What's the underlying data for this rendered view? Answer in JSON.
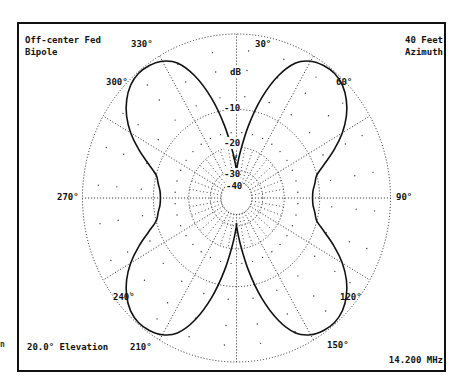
{
  "chart_data": {
    "type": "polar",
    "title": "Off-center Fed Bipole",
    "title_lines": [
      "Off-center Fed",
      "Bipole"
    ],
    "subtitle_lines": [
      "40 Feet",
      "Azimuth"
    ],
    "elevation_label": "20.0° Elevation",
    "frequency_label": "14.200 MHz",
    "radial_unit": "dB",
    "radial_ticks": [
      "-10",
      "-20",
      "-30",
      "-40"
    ],
    "radial_marker": "v",
    "angle_ticks": [
      {
        "angle": 0,
        "label": ""
      },
      {
        "angle": 30,
        "label": "30°"
      },
      {
        "angle": 60,
        "label": "60°"
      },
      {
        "angle": 90,
        "label": "90°"
      },
      {
        "angle": 120,
        "label": "120°"
      },
      {
        "angle": 150,
        "label": "150°"
      },
      {
        "angle": 180,
        "label": ""
      },
      {
        "angle": 210,
        "label": "210°"
      },
      {
        "angle": 240,
        "label": "240°"
      },
      {
        "angle": 270,
        "label": "270°"
      },
      {
        "angle": 300,
        "label": "300°"
      },
      {
        "angle": 330,
        "label": "330°"
      }
    ],
    "rings_db": [
      0,
      -10,
      -20,
      -30,
      -40
    ],
    "series": [
      {
        "name": "Azimuth pattern",
        "angles_deg": [
          0,
          5,
          10,
          15,
          20,
          25,
          30,
          35,
          40,
          45,
          50,
          55,
          60,
          65,
          70,
          75,
          80,
          85,
          90
        ],
        "gain_db": [
          -30,
          -22,
          -14,
          -8,
          -4.5,
          -2,
          -0.8,
          -0.3,
          -0.2,
          -0.6,
          -1.5,
          -2.8,
          -4.5,
          -6.5,
          -8.5,
          -10,
          -11,
          -11.8,
          -12
        ],
        "symmetry": "four-fold mirror (about 0-180 and 90-270 axes)"
      }
    ]
  },
  "labels": {
    "title1": "Off-center Fed",
    "title2": "Bipole",
    "sub1": "40 Feet",
    "sub2": "Azimuth",
    "elevation": "20.0° Elevation",
    "frequency": "14.200 MHz",
    "db": "dB",
    "r10": "-10",
    "r20": "-20",
    "r30": "-30",
    "r40": "-40",
    "marker": "v",
    "a30": "30°",
    "a60": "60°",
    "a90": "90°",
    "a120": "120°",
    "a150": "150°",
    "a210": "210°",
    "a240": "240°",
    "a270": "270°",
    "a300": "300°",
    "a330": "330°",
    "stray": "n"
  }
}
